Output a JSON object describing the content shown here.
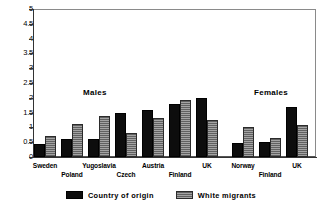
{
  "chart_data": {
    "type": "bar",
    "title": "",
    "subtitle": "",
    "xlabel": "",
    "ylabel": "",
    "ylim": [
      0,
      5
    ],
    "ytick_labels": [
      "5",
      "4.5",
      "4",
      "3.5",
      "3",
      "2.5",
      "2",
      "1.5",
      "1",
      "0.5",
      "0"
    ],
    "ytick_values": [
      5,
      4.5,
      4,
      3.5,
      3,
      2.5,
      2,
      1.5,
      1,
      0.5,
      0
    ],
    "grid": false,
    "legend_position": "bottom-center",
    "categories": [
      "Sweden",
      "Poland",
      "Yugoslavia",
      "Czech",
      "Austria",
      "Finland",
      "UK",
      "Norway",
      "Finland",
      "UK"
    ],
    "series": [
      {
        "name": "Country of origin",
        "color": "#0d0d0d",
        "values": [
          0.45,
          0.6,
          0.6,
          1.5,
          1.6,
          1.8,
          2.0,
          0.48,
          0.5,
          1.7
        ]
      },
      {
        "name": "White migrants",
        "color": "#8f8f8f",
        "values": [
          0.72,
          1.13,
          1.4,
          0.8,
          1.32,
          1.93,
          1.25,
          1.03,
          0.63,
          1.08
        ]
      }
    ],
    "annotations": [
      {
        "text": "Males",
        "x_category_index": 2,
        "y_value": 2.15
      },
      {
        "text": "Females",
        "x_category_index": 8,
        "y_value": 2.15
      }
    ],
    "groups": [
      {
        "label": "Males",
        "category_indices": [
          0,
          1,
          2,
          3,
          4,
          5,
          6
        ]
      },
      {
        "label": "Females",
        "category_indices": [
          7,
          8,
          9
        ]
      }
    ]
  },
  "legend": {
    "items": [
      {
        "label": "Country of origin",
        "swatch": "origin"
      },
      {
        "label": "White migrants",
        "swatch": "migrant"
      }
    ]
  }
}
